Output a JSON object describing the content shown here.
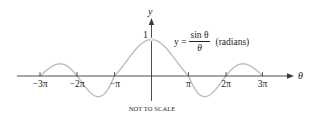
{
  "chart_data": {
    "type": "line",
    "title": "",
    "function": "y = sin(θ)/θ",
    "equation": {
      "lhs": "y =",
      "numerator": "sin θ",
      "denominator": "θ",
      "note": "(radians)"
    },
    "xlabel": "θ",
    "ylabel": "y",
    "x_ticks": [
      "-3π",
      "-2π",
      "-π",
      "π",
      "2π",
      "3π"
    ],
    "x_tick_values": [
      -9.4248,
      -6.2832,
      -3.1416,
      3.1416,
      6.2832,
      9.4248
    ],
    "y_ticks": [
      "1"
    ],
    "y_tick_values": [
      1
    ],
    "xlim": [
      -3.6,
      4.4
    ],
    "ylim": [
      -0.25,
      1.2
    ],
    "open_point": {
      "x": 0,
      "y": 1
    },
    "grid": false,
    "legend": null,
    "annotation": "NOT TO SCALE",
    "colors": {
      "curve": "#bdbdbd",
      "axes": "#3a3a3a",
      "text": "#231f20"
    }
  },
  "labels": {
    "y_axis": "y",
    "x_axis": "θ",
    "y_one": "1",
    "ticks": [
      "−3π",
      "−2π",
      "−π",
      "π",
      "2π",
      "3π"
    ],
    "eq_lhs": "y =",
    "eq_num": "sin θ",
    "eq_den": "θ",
    "eq_note": "(radians)",
    "footnote": "NOT TO SCALE"
  }
}
